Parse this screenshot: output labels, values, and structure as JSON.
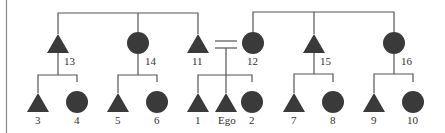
{
  "diagram": {
    "type": "kinship-chart",
    "colors": {
      "line": "#555555",
      "fill": "#3a3a3a",
      "text": "#333333",
      "border": "#888888"
    },
    "nodes": [
      {
        "id": "13",
        "label": "13",
        "sex": "male",
        "generation": 1
      },
      {
        "id": "14",
        "label": "14",
        "sex": "female",
        "generation": 1
      },
      {
        "id": "11",
        "label": "11",
        "sex": "male",
        "generation": 1
      },
      {
        "id": "12",
        "label": "12",
        "sex": "female",
        "generation": 1
      },
      {
        "id": "15",
        "label": "15",
        "sex": "male",
        "generation": 1
      },
      {
        "id": "16",
        "label": "16",
        "sex": "female",
        "generation": 1
      },
      {
        "id": "3",
        "label": "3",
        "sex": "male",
        "generation": 2
      },
      {
        "id": "4",
        "label": "4",
        "sex": "female",
        "generation": 2
      },
      {
        "id": "5",
        "label": "5",
        "sex": "male",
        "generation": 2
      },
      {
        "id": "6",
        "label": "6",
        "sex": "female",
        "generation": 2
      },
      {
        "id": "1",
        "label": "1",
        "sex": "male",
        "generation": 2
      },
      {
        "id": "ego",
        "label": "Ego",
        "sex": "male",
        "generation": 2
      },
      {
        "id": "2",
        "label": "2",
        "sex": "female",
        "generation": 2
      },
      {
        "id": "7",
        "label": "7",
        "sex": "male",
        "generation": 2
      },
      {
        "id": "8",
        "label": "8",
        "sex": "female",
        "generation": 2
      },
      {
        "id": "9",
        "label": "9",
        "sex": "male",
        "generation": 2
      },
      {
        "id": "10",
        "label": "10",
        "sex": "female",
        "generation": 2
      }
    ],
    "sibling_groups": [
      [
        "13",
        "14",
        "11"
      ],
      [
        "12",
        "15",
        "16"
      ],
      [
        "3",
        "4"
      ],
      [
        "5",
        "6"
      ],
      [
        "1",
        "ego",
        "2"
      ],
      [
        "7",
        "8"
      ],
      [
        "9",
        "10"
      ]
    ],
    "marriages": [
      [
        "11",
        "12"
      ]
    ],
    "descent": [
      {
        "parent": "13",
        "children": [
          "3",
          "4"
        ]
      },
      {
        "parent": "14",
        "children": [
          "5",
          "6"
        ]
      },
      {
        "parents": [
          "11",
          "12"
        ],
        "children": [
          "1",
          "ego",
          "2"
        ]
      },
      {
        "parent": "15",
        "children": [
          "7",
          "8"
        ]
      },
      {
        "parent": "16",
        "children": [
          "9",
          "10"
        ]
      }
    ],
    "labels": {
      "n13": "13",
      "n14": "14",
      "n11": "11",
      "n12": "12",
      "n15": "15",
      "n16": "16",
      "n3": "3",
      "n4": "4",
      "n5": "5",
      "n6": "6",
      "n1": "1",
      "ego": "Ego",
      "n2": "2",
      "n7": "7",
      "n8": "8",
      "n9": "9",
      "n10": "10"
    }
  }
}
